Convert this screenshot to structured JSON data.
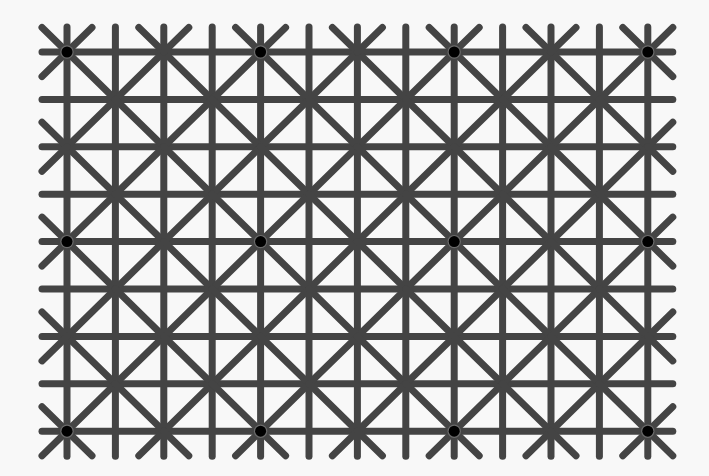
{
  "image": {
    "width": 709,
    "height": 476,
    "background": "#f8f8f8"
  },
  "grid": {
    "origin_x": 67,
    "origin_y": 52,
    "spacing_x": 48.4,
    "spacing_y": 47.4,
    "columns": 13,
    "rows": 9,
    "extension": 25,
    "line_color": "#444444",
    "line_width": 7
  },
  "dots": {
    "color": "#000000",
    "radius": 5.5,
    "halo_color": "#6a6a6a",
    "positions": [
      {
        "col": 0,
        "row": 0
      },
      {
        "col": 4,
        "row": 0
      },
      {
        "col": 8,
        "row": 0
      },
      {
        "col": 12,
        "row": 0
      },
      {
        "col": 0,
        "row": 4
      },
      {
        "col": 4,
        "row": 4
      },
      {
        "col": 8,
        "row": 4
      },
      {
        "col": 12,
        "row": 4
      },
      {
        "col": 0,
        "row": 8
      },
      {
        "col": 4,
        "row": 8
      },
      {
        "col": 8,
        "row": 8
      },
      {
        "col": 12,
        "row": 8
      }
    ]
  }
}
